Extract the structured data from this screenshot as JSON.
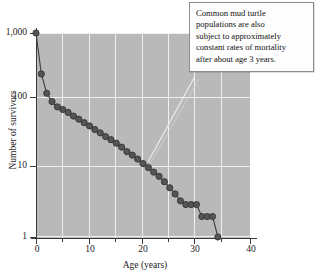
{
  "chart_data": {
    "type": "line",
    "title": "",
    "subtitle": "",
    "xlabel": "Age (years)",
    "ylabel": "Number of survivors",
    "xlim": [
      0,
      40
    ],
    "ylim": [
      1,
      1000
    ],
    "yscale": "log",
    "xscale": "linear",
    "grid": true,
    "legend": null,
    "x_ticks": [
      "0",
      "10",
      "20",
      "30",
      "40"
    ],
    "x_tick_values": [
      0,
      10,
      20,
      30,
      40
    ],
    "x_minor_tick_values": [
      5,
      15,
      25,
      35
    ],
    "y_ticks": [
      "1,000",
      "100",
      "10",
      "1"
    ],
    "y_tick_values": [
      1000,
      100,
      10,
      1
    ],
    "series": [
      {
        "name": "Common mud turtle survivorship",
        "marker": "circle",
        "marker_color": "#555555",
        "line_color": "#3d3d3d",
        "x": [
          0,
          1,
          2,
          3,
          4,
          5,
          6,
          7,
          8,
          9,
          10,
          11,
          12,
          13,
          14,
          15,
          16,
          17,
          18,
          19,
          20,
          21,
          22,
          23,
          24,
          25,
          26,
          27,
          28,
          29,
          30,
          31,
          32,
          33,
          34
        ],
        "values": [
          1000,
          250,
          130,
          98,
          82,
          75,
          68,
          60,
          54,
          48,
          43,
          38,
          34,
          30,
          27,
          24,
          21,
          18,
          16,
          14,
          12,
          10.5,
          9,
          7.8,
          6.5,
          5.3,
          4.3,
          3.4,
          3.0,
          3.0,
          3.0,
          2.0,
          2.0,
          2.0,
          1.0
        ]
      }
    ],
    "annotations": [
      {
        "name": "mortality-note",
        "text": "Common mud turtle populations are also subject to approximately constant rates of mortality after about age 3 years.",
        "lines": [
          "Common mud turtle",
          "populations are also",
          "subject to approximately",
          "constant rates of mortality",
          "after about age 3 years."
        ],
        "target_x": 20,
        "target_y": 10
      }
    ],
    "colors": {
      "plot_background": "#b9b9b9",
      "gridline": "#f0f0f0",
      "axis": "#3a3a3a",
      "marker_fill": "#555555",
      "marker_stroke": "#333333",
      "annotation_background": "#fdfdfd",
      "annotation_border": "#8d8d8d",
      "leader_line": "#efefef"
    }
  }
}
